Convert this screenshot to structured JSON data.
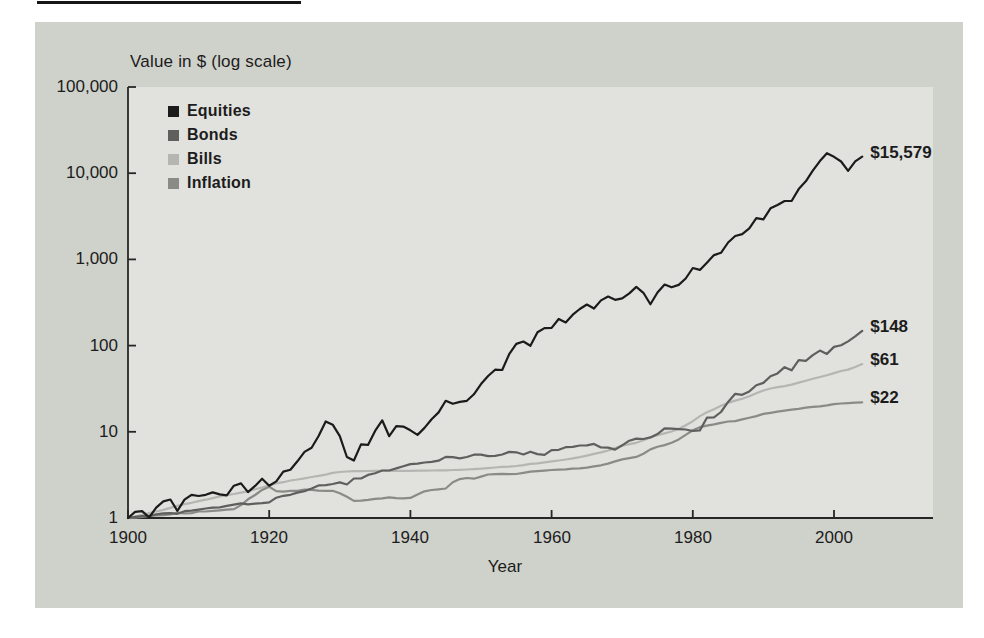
{
  "chart_data": {
    "type": "line",
    "title": "Value in $ (log scale)",
    "xlabel": "Year",
    "y_scale": "log",
    "grid": false,
    "legend_position": "top-left-inside",
    "x_start": 1900,
    "x_end": 2004,
    "x_axis_max": 2014,
    "ylim": [
      1,
      100000
    ],
    "y_tick_values": [
      1,
      10,
      100,
      1000,
      10000,
      100000
    ],
    "y_tick_labels": [
      "1",
      "10",
      "100",
      "1,000",
      "10,000",
      "100,000"
    ],
    "x_tick_values": [
      1900,
      1920,
      1940,
      1960,
      1980,
      2000
    ],
    "x_tick_labels": [
      "1900",
      "1920",
      "1940",
      "1960",
      "1980",
      "2000"
    ],
    "series": [
      {
        "name": "Equities",
        "color": "#1b1b1b",
        "end_label": "$15,579",
        "end_value": 15579,
        "values": [
          1.0,
          1.18,
          1.2,
          1.02,
          1.32,
          1.56,
          1.64,
          1.21,
          1.63,
          1.86,
          1.8,
          1.86,
          1.98,
          1.88,
          1.83,
          2.37,
          2.52,
          2.0,
          2.36,
          2.86,
          2.37,
          2.66,
          3.45,
          3.62,
          4.55,
          5.85,
          6.52,
          8.95,
          13.2,
          12.1,
          8.9,
          5.1,
          4.65,
          7.15,
          7.05,
          10.25,
          13.6,
          8.9,
          11.6,
          11.5,
          10.4,
          9.2,
          11.1,
          14.0,
          16.8,
          22.9,
          21.1,
          22.2,
          22.9,
          27.2,
          35.8,
          44.4,
          52.6,
          52.1,
          79.5,
          104.6,
          111.5,
          99.5,
          142.6,
          159.7,
          160.5,
          203.7,
          185.9,
          228.4,
          266.1,
          299.4,
          269.5,
          334.1,
          371.0,
          339.5,
          353.1,
          403.6,
          480.3,
          409.7,
          301.1,
          412.9,
          511.6,
          474.8,
          506.1,
          599.7,
          793.7,
          754.5,
          916.7,
          1122,
          1193,
          1572,
          1866,
          1964,
          2292,
          3012,
          2918,
          3913,
          4271,
          4753,
          4760,
          6545,
          8046,
          10718,
          13810,
          17060,
          15510,
          13660,
          10660,
          13700,
          15579
        ]
      },
      {
        "name": "Bonds",
        "color": "#5f5f5d",
        "end_label": "$148",
        "end_value": 148,
        "values": [
          1.0,
          1.03,
          1.05,
          1.06,
          1.1,
          1.13,
          1.14,
          1.12,
          1.2,
          1.22,
          1.25,
          1.29,
          1.32,
          1.33,
          1.38,
          1.43,
          1.48,
          1.44,
          1.47,
          1.49,
          1.52,
          1.72,
          1.81,
          1.86,
          1.97,
          2.05,
          2.2,
          2.39,
          2.4,
          2.48,
          2.59,
          2.45,
          2.87,
          2.87,
          3.16,
          3.31,
          3.56,
          3.56,
          3.76,
          3.98,
          4.22,
          4.26,
          4.4,
          4.49,
          4.62,
          5.12,
          5.07,
          4.93,
          5.1,
          5.43,
          5.43,
          5.21,
          5.27,
          5.46,
          5.85,
          5.78,
          5.46,
          5.87,
          5.51,
          5.39,
          6.13,
          6.19,
          6.62,
          6.7,
          6.93,
          6.98,
          7.24,
          6.57,
          6.55,
          6.22,
          6.97,
          7.89,
          8.34,
          8.24,
          8.6,
          9.4,
          10.96,
          10.89,
          10.76,
          10.63,
          10.21,
          10.39,
          14.58,
          14.68,
          16.96,
          22.24,
          27.61,
          26.86,
          29.43,
          34.74,
          36.88,
          43.99,
          47.54,
          56.2,
          51.7,
          67.8,
          66.7,
          77.3,
          87.4,
          80.2,
          96.6,
          100.9,
          112.0,
          128.0,
          148.0
        ]
      },
      {
        "name": "Bills",
        "color": "#b5b5b1",
        "end_label": "$61",
        "end_value": 61,
        "values": [
          1.0,
          1.04,
          1.09,
          1.14,
          1.19,
          1.24,
          1.31,
          1.38,
          1.45,
          1.5,
          1.57,
          1.63,
          1.7,
          1.78,
          1.84,
          1.9,
          1.97,
          2.04,
          2.15,
          2.26,
          2.39,
          2.52,
          2.6,
          2.72,
          2.8,
          2.89,
          2.99,
          3.08,
          3.19,
          3.34,
          3.42,
          3.46,
          3.49,
          3.5,
          3.51,
          3.52,
          3.52,
          3.53,
          3.53,
          3.53,
          3.53,
          3.54,
          3.55,
          3.56,
          3.57,
          3.58,
          3.6,
          3.62,
          3.65,
          3.69,
          3.73,
          3.79,
          3.85,
          3.92,
          3.95,
          4.01,
          4.11,
          4.24,
          4.3,
          4.43,
          4.54,
          4.64,
          4.77,
          4.92,
          5.09,
          5.29,
          5.54,
          5.77,
          6.07,
          6.47,
          6.89,
          7.19,
          7.46,
          7.98,
          8.62,
          9.12,
          9.58,
          10.07,
          10.79,
          11.92,
          13.26,
          15.21,
          16.82,
          18.3,
          20.1,
          21.65,
          22.99,
          24.24,
          25.78,
          27.94,
          30.12,
          31.81,
          32.92,
          33.91,
          35.24,
          37.21,
          39.15,
          41.21,
          43.21,
          45.24,
          48.0,
          50.8,
          52.7,
          56.5,
          61.0
        ]
      },
      {
        "name": "Inflation",
        "color": "#8a8a87",
        "end_label": "$22",
        "end_value": 22,
        "values": [
          1.0,
          1.01,
          1.03,
          1.06,
          1.07,
          1.08,
          1.1,
          1.15,
          1.13,
          1.14,
          1.19,
          1.19,
          1.21,
          1.23,
          1.25,
          1.27,
          1.41,
          1.65,
          1.85,
          2.12,
          2.3,
          2.05,
          2.02,
          2.07,
          2.07,
          2.14,
          2.12,
          2.08,
          2.06,
          2.07,
          1.94,
          1.76,
          1.58,
          1.59,
          1.62,
          1.67,
          1.69,
          1.74,
          1.7,
          1.69,
          1.71,
          1.87,
          2.04,
          2.11,
          2.15,
          2.2,
          2.6,
          2.83,
          2.91,
          2.86,
          3.02,
          3.2,
          3.23,
          3.25,
          3.23,
          3.24,
          3.34,
          3.44,
          3.5,
          3.55,
          3.6,
          3.63,
          3.67,
          3.73,
          3.77,
          3.84,
          3.97,
          4.09,
          4.28,
          4.54,
          4.79,
          4.95,
          5.12,
          5.57,
          6.25,
          6.69,
          7.01,
          7.48,
          8.16,
          9.24,
          10.4,
          11.32,
          11.76,
          12.2,
          12.69,
          13.17,
          13.32,
          13.91,
          14.52,
          15.2,
          16.12,
          16.62,
          17.1,
          17.57,
          18.04,
          18.5,
          19.11,
          19.44,
          19.75,
          20.28,
          20.97,
          21.3,
          21.55,
          21.8,
          22.0
        ]
      }
    ]
  }
}
